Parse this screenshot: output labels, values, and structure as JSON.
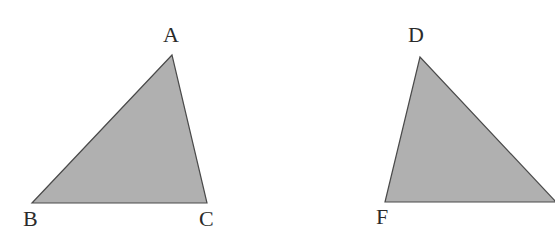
{
  "figure": {
    "type": "geometry-diagram",
    "background_color": "#ffffff",
    "fill_color": "#b0b0b0",
    "stroke_color": "#4a4a4a",
    "label_color": "#2b2b2b",
    "stroke_width": 1.2,
    "width": 555,
    "height": 245
  },
  "shapes": [
    {
      "name": "triangle-abc",
      "vertices": [
        {
          "label": "A",
          "x": 172,
          "y": 55
        },
        {
          "label": "B",
          "x": 32,
          "y": 203
        },
        {
          "label": "C",
          "x": 207,
          "y": 203
        }
      ],
      "points_attr": "172,55 32,203 207,203"
    },
    {
      "name": "triangle-def",
      "vertices": [
        {
          "label": "D",
          "x": 420,
          "y": 57
        },
        {
          "label": "F",
          "x": 385,
          "y": 202
        },
        {
          "label": "E",
          "x": 556,
          "y": 202
        }
      ],
      "points_attr": "420,57 385,202 556,202"
    }
  ],
  "labels": [
    {
      "name": "label-a",
      "text": "A",
      "x": 163,
      "y": 24
    },
    {
      "name": "label-b",
      "text": "B",
      "x": 23,
      "y": 208
    },
    {
      "name": "label-c",
      "text": "C",
      "x": 199,
      "y": 208
    },
    {
      "name": "label-d",
      "text": "D",
      "x": 408,
      "y": 24
    },
    {
      "name": "label-f",
      "text": "F",
      "x": 376,
      "y": 206
    }
  ]
}
